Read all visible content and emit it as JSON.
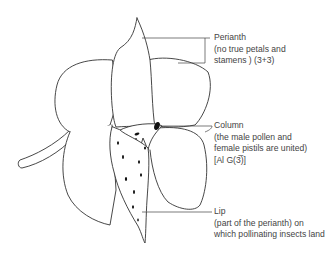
{
  "labels": {
    "perianth": {
      "title": "Perianth",
      "lines": [
        "(no true petals and",
        "stamens ) (3+3)"
      ]
    },
    "column": {
      "title": "Column",
      "lines": [
        "(the male pollen and",
        "female pistils are united)",
        "[Al G(3̅)]"
      ]
    },
    "lip": {
      "title": "Lip",
      "lines": [
        "(part of the perianth) on",
        "which pollinating insects land"
      ]
    }
  },
  "colors": {
    "stroke": "#333333",
    "fill": "#ffffff",
    "text": "#444444"
  }
}
